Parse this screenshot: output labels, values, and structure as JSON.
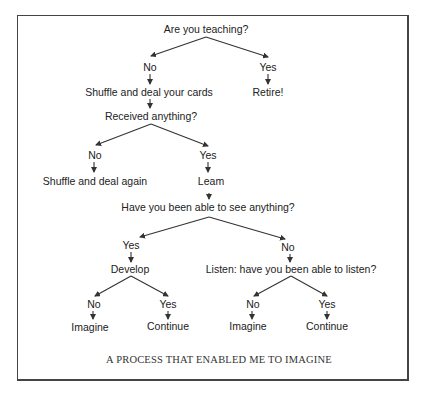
{
  "diagram": {
    "type": "flowchart",
    "caption": "A PROCESS THAT ENABLED ME TO IMAGINE",
    "nodes": {
      "q_teaching": "Are you teaching?",
      "teaching_no": "No",
      "teaching_yes": "Yes",
      "shuffle_deal": "Shuffle and deal your cards",
      "retire": "Retire!",
      "q_received": "Received anything?",
      "received_no": "No",
      "received_yes": "Yes",
      "shuffle_again": "Shuffle and deal again",
      "learn": "Leam",
      "q_see": "Have you been able to see anything?",
      "see_yes": "Yes",
      "see_no": "No",
      "develop": "Develop",
      "q_listen": "Listen: have you been able to listen?",
      "develop_no": "No",
      "develop_yes": "Yes",
      "listen_no": "No",
      "listen_yes": "Yes",
      "develop_imagine": "Imagine",
      "develop_continue": "Continue",
      "listen_imagine": "Imagine",
      "listen_continue": "Continue"
    },
    "edges": [
      [
        "q_teaching",
        "teaching_no"
      ],
      [
        "q_teaching",
        "teaching_yes"
      ],
      [
        "teaching_no",
        "shuffle_deal"
      ],
      [
        "teaching_yes",
        "retire"
      ],
      [
        "shuffle_deal",
        "q_received"
      ],
      [
        "q_received",
        "received_no"
      ],
      [
        "q_received",
        "received_yes"
      ],
      [
        "received_no",
        "shuffle_again"
      ],
      [
        "received_yes",
        "learn"
      ],
      [
        "learn",
        "q_see"
      ],
      [
        "q_see",
        "see_yes"
      ],
      [
        "q_see",
        "see_no"
      ],
      [
        "see_yes",
        "develop"
      ],
      [
        "see_no",
        "q_listen"
      ],
      [
        "develop",
        "develop_no"
      ],
      [
        "develop",
        "develop_yes"
      ],
      [
        "develop_no",
        "develop_imagine"
      ],
      [
        "develop_yes",
        "develop_continue"
      ],
      [
        "q_listen",
        "listen_no"
      ],
      [
        "q_listen",
        "listen_yes"
      ],
      [
        "listen_no",
        "listen_imagine"
      ],
      [
        "listen_yes",
        "listen_continue"
      ]
    ],
    "colors": {
      "line": "#333333",
      "text": "#222222",
      "frame": "#444444"
    }
  }
}
